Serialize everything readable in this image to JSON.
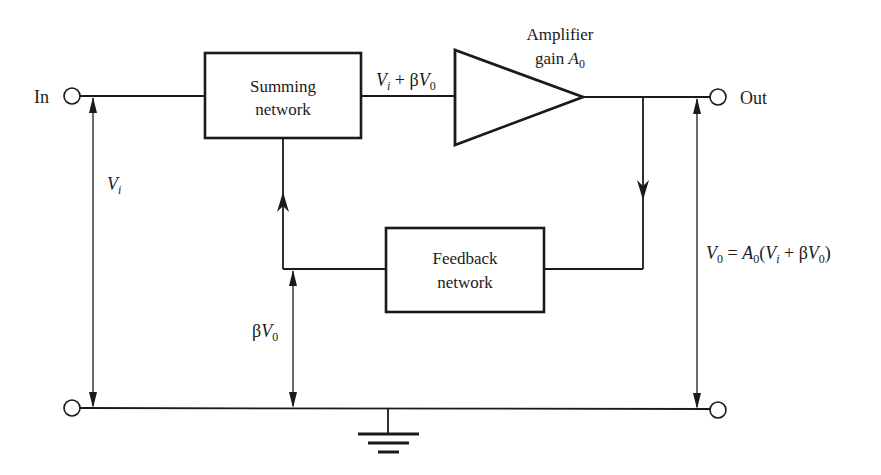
{
  "diagram": {
    "terminals": {
      "input_label": "In",
      "output_label": "Out"
    },
    "blocks": {
      "summing": {
        "line1": "Summing",
        "line2": "network"
      },
      "feedback": {
        "line1": "Feedback",
        "line2": "network"
      },
      "amplifier": {
        "line1": "Amplifier",
        "line2_prefix": "gain ",
        "gain_symbol": "A",
        "gain_subscript": "0"
      }
    },
    "signals": {
      "summing_output": {
        "v": "V",
        "v_sub": "i",
        "op": " + β",
        "v2": "V",
        "v2_sub": "0"
      },
      "input_voltage": {
        "v": "V",
        "v_sub": "i"
      },
      "feedback_voltage": {
        "beta": "β",
        "v": "V",
        "v_sub": "0"
      },
      "output_equation": {
        "lhs": "V",
        "lhs_sub": "0",
        "eq": " = ",
        "a": "A",
        "a_sub": "0",
        "open": "(",
        "vi": "V",
        "vi_sub": "i",
        "plus": " + β",
        "vo": "V",
        "vo_sub": "0",
        "close": ")"
      }
    },
    "colors": {
      "stroke": "#1a1a1a",
      "background": "#ffffff"
    }
  }
}
